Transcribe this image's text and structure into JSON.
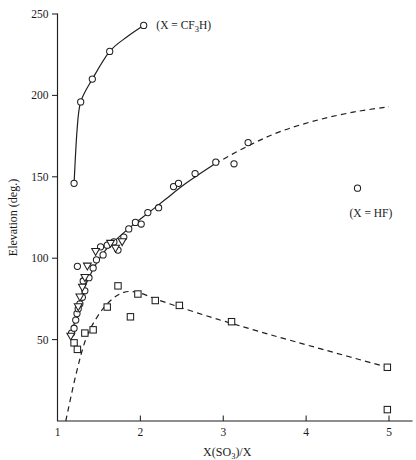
{
  "chart_data": {
    "type": "scatter",
    "title": "",
    "xlabel": "X(SO3)/X",
    "xlabel_parts": {
      "pre": "X(SO",
      "sub": "3",
      "post": ")/X"
    },
    "ylabel": "Elevation (deg.)",
    "xlim": [
      1,
      5.35
    ],
    "ylim": [
      0,
      250
    ],
    "xticks": [
      1,
      2,
      3,
      4,
      5
    ],
    "xtick_labels": [
      "1",
      "2",
      "3",
      "4",
      "5"
    ],
    "yticks": [
      50,
      100,
      150,
      200,
      250
    ],
    "ytick_labels": [
      "50",
      "100",
      "150",
      "200",
      "250"
    ],
    "grid": false,
    "legend_position": "inline-annotations",
    "annotations": [
      {
        "name": "cf3h-label",
        "text": "(X = CF3H)",
        "pre": "(X = CF",
        "sub": "3",
        "post": "H)",
        "x": 2.12,
        "y": 243
      },
      {
        "name": "hf-label",
        "text": "(X = HF)",
        "pre": "(X = HF)",
        "sub": "",
        "post": "",
        "x": 4.45,
        "y": 128
      }
    ],
    "series": [
      {
        "name": "CF3H series",
        "marker": "circle",
        "line": "solid",
        "points": [
          {
            "x": 1.2,
            "y": 146
          },
          {
            "x": 1.28,
            "y": 196
          },
          {
            "x": 1.42,
            "y": 210
          },
          {
            "x": 1.63,
            "y": 227
          },
          {
            "x": 2.04,
            "y": 243
          }
        ],
        "curve": [
          {
            "x": 1.2,
            "y": 146
          },
          {
            "x": 1.235,
            "y": 178
          },
          {
            "x": 1.28,
            "y": 196
          },
          {
            "x": 1.42,
            "y": 210
          },
          {
            "x": 1.63,
            "y": 227
          },
          {
            "x": 1.84,
            "y": 236
          },
          {
            "x": 2.04,
            "y": 243
          }
        ]
      },
      {
        "name": "HF series",
        "marker": "circle",
        "line": "solid-then-dashed",
        "dash_start_x": 2.9,
        "points": [
          {
            "x": 1.17,
            "y": 54
          },
          {
            "x": 1.2,
            "y": 57
          },
          {
            "x": 1.22,
            "y": 62
          },
          {
            "x": 1.235,
            "y": 66
          },
          {
            "x": 1.25,
            "y": 69
          },
          {
            "x": 1.27,
            "y": 72
          },
          {
            "x": 1.3,
            "y": 76
          },
          {
            "x": 1.33,
            "y": 80
          },
          {
            "x": 1.31,
            "y": 86
          },
          {
            "x": 1.38,
            "y": 88
          },
          {
            "x": 1.24,
            "y": 95
          },
          {
            "x": 1.43,
            "y": 94
          },
          {
            "x": 1.47,
            "y": 99
          },
          {
            "x": 1.55,
            "y": 102
          },
          {
            "x": 1.52,
            "y": 107
          },
          {
            "x": 1.6,
            "y": 108
          },
          {
            "x": 1.68,
            "y": 110
          },
          {
            "x": 1.73,
            "y": 105
          },
          {
            "x": 1.8,
            "y": 113
          },
          {
            "x": 1.86,
            "y": 118
          },
          {
            "x": 1.94,
            "y": 122
          },
          {
            "x": 2.01,
            "y": 121
          },
          {
            "x": 2.09,
            "y": 128
          },
          {
            "x": 2.22,
            "y": 131
          },
          {
            "x": 2.4,
            "y": 144
          },
          {
            "x": 2.46,
            "y": 146
          },
          {
            "x": 2.66,
            "y": 152
          },
          {
            "x": 2.91,
            "y": 159
          },
          {
            "x": 3.13,
            "y": 158
          },
          {
            "x": 3.3,
            "y": 171
          }
        ],
        "curve": [
          {
            "x": 1.16,
            "y": 50
          },
          {
            "x": 1.22,
            "y": 64
          },
          {
            "x": 1.28,
            "y": 76
          },
          {
            "x": 1.36,
            "y": 86
          },
          {
            "x": 1.46,
            "y": 96
          },
          {
            "x": 1.58,
            "y": 105
          },
          {
            "x": 1.72,
            "y": 112
          },
          {
            "x": 1.9,
            "y": 120
          },
          {
            "x": 2.1,
            "y": 128
          },
          {
            "x": 2.3,
            "y": 136
          },
          {
            "x": 2.55,
            "y": 146
          },
          {
            "x": 2.9,
            "y": 158
          },
          {
            "x": 3.3,
            "y": 169
          },
          {
            "x": 3.7,
            "y": 178
          },
          {
            "x": 4.15,
            "y": 185
          },
          {
            "x": 4.6,
            "y": 190
          },
          {
            "x": 5.0,
            "y": 193
          }
        ]
      },
      {
        "name": "HF outlier point",
        "marker": "circle",
        "line": "none",
        "points": [
          {
            "x": 4.62,
            "y": 143
          }
        ]
      },
      {
        "name": "triangle series",
        "marker": "triangle-down",
        "line": "none",
        "points": [
          {
            "x": 1.16,
            "y": 52
          },
          {
            "x": 1.25,
            "y": 70
          },
          {
            "x": 1.27,
            "y": 76
          },
          {
            "x": 1.3,
            "y": 82
          },
          {
            "x": 1.33,
            "y": 88
          },
          {
            "x": 1.36,
            "y": 95
          },
          {
            "x": 1.46,
            "y": 104
          },
          {
            "x": 1.64,
            "y": 109
          },
          {
            "x": 1.7,
            "y": 106
          },
          {
            "x": 1.78,
            "y": 110
          }
        ]
      },
      {
        "name": "square series",
        "marker": "square",
        "line": "dashed",
        "points": [
          {
            "x": 1.2,
            "y": 48
          },
          {
            "x": 1.24,
            "y": 44
          },
          {
            "x": 1.33,
            "y": 54
          },
          {
            "x": 1.43,
            "y": 56
          },
          {
            "x": 1.6,
            "y": 70
          },
          {
            "x": 1.73,
            "y": 83
          },
          {
            "x": 1.88,
            "y": 64
          },
          {
            "x": 1.97,
            "y": 78
          },
          {
            "x": 2.18,
            "y": 74
          },
          {
            "x": 2.47,
            "y": 71
          },
          {
            "x": 3.1,
            "y": 61
          },
          {
            "x": 4.98,
            "y": 33
          },
          {
            "x": 4.98,
            "y": 7
          }
        ],
        "curve": [
          {
            "x": 1.1,
            "y": 0
          },
          {
            "x": 1.22,
            "y": 28
          },
          {
            "x": 1.34,
            "y": 50
          },
          {
            "x": 1.48,
            "y": 64
          },
          {
            "x": 1.64,
            "y": 74
          },
          {
            "x": 1.8,
            "y": 79
          },
          {
            "x": 1.97,
            "y": 79
          },
          {
            "x": 2.18,
            "y": 75
          },
          {
            "x": 2.47,
            "y": 70
          },
          {
            "x": 2.9,
            "y": 63
          },
          {
            "x": 3.5,
            "y": 54
          },
          {
            "x": 4.2,
            "y": 44
          },
          {
            "x": 4.98,
            "y": 33
          }
        ]
      }
    ]
  }
}
